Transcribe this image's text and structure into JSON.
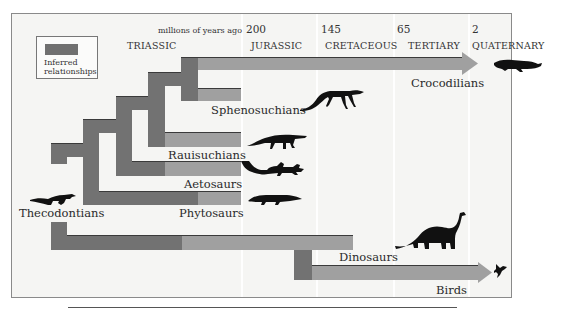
{
  "timeline": {
    "unit_label": "millions of years ago",
    "ticks": [
      {
        "value": "200"
      },
      {
        "value": "145"
      },
      {
        "value": "65"
      },
      {
        "value": "2"
      }
    ],
    "eras": [
      {
        "label": "TRIASSIC"
      },
      {
        "label": "JURASSIC"
      },
      {
        "label": "CRETACEOUS"
      },
      {
        "label": "TERTIARY"
      },
      {
        "label": "QUATERNARY"
      }
    ]
  },
  "legend": {
    "swatch_color": "#707070",
    "label_line1": "Inferred",
    "label_line2": "relationships"
  },
  "colors": {
    "inferred": "#727272",
    "known": "#a0a0a0",
    "background": "#f5f5f3"
  },
  "taxa": [
    {
      "label": "Crocodilians",
      "icon": "crocodile-silhouette"
    },
    {
      "label": "Sphenosuchians",
      "icon": "sphenosuchian-silhouette"
    },
    {
      "label": "Rauisuchians",
      "icon": "rauisuchian-silhouette"
    },
    {
      "label": "Aetosaurs",
      "icon": "aetosaur-silhouette"
    },
    {
      "label": "Phytosaurs",
      "icon": "phytosaur-silhouette"
    },
    {
      "label": "Thecodontians",
      "icon": "thecodont-silhouette"
    },
    {
      "label": "Dinosaurs",
      "icon": "sauropod-silhouette"
    },
    {
      "label": "Birds",
      "icon": "bird-silhouette"
    }
  ]
}
